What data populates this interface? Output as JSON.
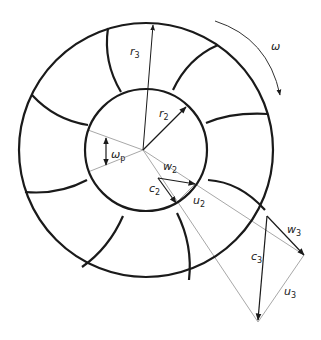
{
  "diagram": {
    "labels": {
      "r3": {
        "base": "r",
        "sub": "3"
      },
      "r2": {
        "base": "r",
        "sub": "2"
      },
      "omega": {
        "base": "ω"
      },
      "omega_p": {
        "base": "ω",
        "sub": "p"
      },
      "w2": {
        "base": "w",
        "sub": "2"
      },
      "c2": {
        "base": "c",
        "sub": "2"
      },
      "u2": {
        "base": "u",
        "sub": "2"
      },
      "w3": {
        "base": "w",
        "sub": "3"
      },
      "c3": {
        "base": "c",
        "sub": "3"
      },
      "u3": {
        "base": "u",
        "sub": "3"
      }
    },
    "geometry": {
      "center": [
        143,
        150
      ],
      "outer_radius": 127,
      "inner_radius": 60,
      "blade_count": 8
    },
    "colors": {
      "stroke": "#1a1a1a",
      "construction": "#a8a8a8"
    }
  }
}
